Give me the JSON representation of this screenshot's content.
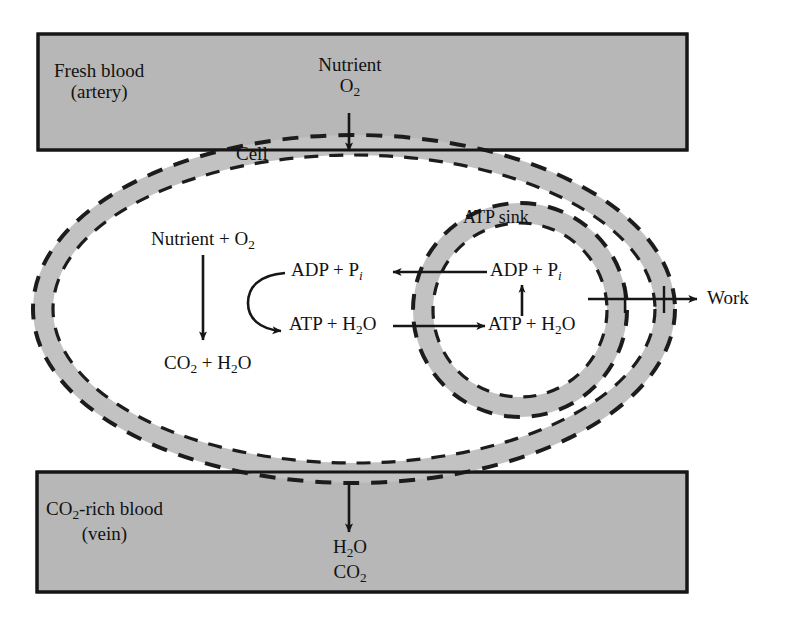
{
  "diagram": {
    "title_role": "cell-energy-metabolism-diagram",
    "colors": {
      "blood_fill": "#b7b7b7",
      "membrane_fill": "#c2c2c2",
      "cytosol_fill": "#ffffff",
      "stroke": "#1a1a1a",
      "page_background": "#ffffff"
    },
    "artery_box": {
      "line1": "Fresh blood",
      "line2": "(artery)"
    },
    "vein_box": {
      "line1_pre": "CO",
      "line1_sub": "2",
      "line1_post": "-rich blood",
      "line2": "(vein)"
    },
    "cell": {
      "label": "Cell"
    },
    "atp_sink": {
      "label": "ATP sink"
    },
    "inputs": {
      "nutrient": "Nutrient",
      "oxygen_pre": "O",
      "oxygen_sub": "2"
    },
    "outputs": {
      "water_pre": "H",
      "water_sub": "2",
      "water_post": "O",
      "carbon_dioxide_pre": "CO",
      "carbon_dioxide_sub": "2",
      "work": "Work"
    },
    "reactions": {
      "substrate": "Nutrient + O",
      "substrate_sub": "2",
      "waste_pre": "CO",
      "waste_sub1": "2",
      "waste_mid": " + H",
      "waste_sub2": "2",
      "waste_post": "O",
      "adp_cyto_pre": "ADP + P",
      "adp_cyto_sub": "i",
      "atp_cyto_pre": "ATP + H",
      "atp_cyto_sub": "2",
      "atp_cyto_post": "O",
      "adp_sink_pre": "ADP + P",
      "adp_sink_sub": "i",
      "atp_sink_pre": "ATP + H",
      "atp_sink_sub": "2",
      "atp_sink_post": "O"
    },
    "arrows": [
      {
        "name": "nutrient-uptake-arrow",
        "direction": "down"
      },
      {
        "name": "waste-release-arrow",
        "direction": "down"
      },
      {
        "name": "catabolism-arrow",
        "direction": "down"
      },
      {
        "name": "atp-synthesis-curved-arrow",
        "direction": "clockwise"
      },
      {
        "name": "atp-transport-arrow",
        "direction": "right"
      },
      {
        "name": "adp-return-arrow",
        "direction": "left"
      },
      {
        "name": "atp-hydrolysis-arrow",
        "direction": "up"
      },
      {
        "name": "work-output-arrow",
        "direction": "right"
      }
    ]
  }
}
